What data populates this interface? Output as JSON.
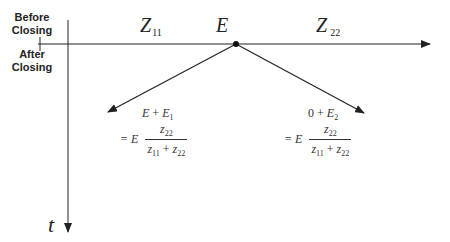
{
  "diagram": {
    "phase_labels": {
      "before": [
        "Before",
        "Closing"
      ],
      "after": [
        "After",
        "Closing"
      ]
    },
    "axes": {
      "horizontal": {
        "description": "position axis",
        "arrow": "right"
      },
      "vertical": {
        "label": "t",
        "arrow": "down"
      }
    },
    "impedances": {
      "left": {
        "symbol": "Z",
        "subscript": "11"
      },
      "right": {
        "symbol": "Z",
        "subscript": "22"
      }
    },
    "junction": {
      "label": "E"
    },
    "left_wave": {
      "line1": {
        "a": "E",
        "op": "+",
        "b": "E",
        "b_sub": "1"
      },
      "line2": {
        "prefix": "= E",
        "numerator": {
          "sym": "z",
          "sub": "22"
        },
        "denominator": {
          "a": "z",
          "a_sub": "11",
          "op": "+",
          "b": "z",
          "b_sub": "22"
        }
      }
    },
    "right_wave": {
      "line1": {
        "a": "0",
        "op": "+",
        "b": "E",
        "b_sub": "2"
      },
      "line2": {
        "prefix": "= E",
        "numerator": {
          "sym": "z",
          "sub": "22"
        },
        "denominator": {
          "a": "z",
          "a_sub": "11",
          "op": "+",
          "b": "z",
          "b_sub": "22"
        }
      }
    },
    "colors": {
      "line": "#222222",
      "text": "#222222",
      "background": "#ffffff"
    }
  }
}
